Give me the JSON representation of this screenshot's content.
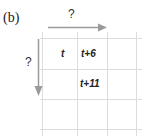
{
  "figure": {
    "label": "(b)",
    "top_arrow_label": "?",
    "left_arrow_label": "?",
    "colors": {
      "grid": "#dcdcdc",
      "arrow": "#9a9a9a",
      "text": "#222222"
    },
    "grid": {
      "rows": 3,
      "cols": 3,
      "cells": [
        [
          "t",
          "t+6",
          ""
        ],
        [
          "",
          "t+11",
          ""
        ],
        [
          "",
          "",
          ""
        ]
      ]
    }
  }
}
